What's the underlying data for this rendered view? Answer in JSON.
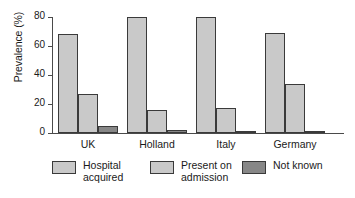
{
  "chart_data": {
    "type": "bar",
    "title": "",
    "xlabel": "",
    "ylabel": "Prevalence (%)",
    "ylim": [
      0,
      80
    ],
    "yticks": [
      0,
      20,
      40,
      60,
      80
    ],
    "ytick_labels": [
      "0",
      "20",
      "40",
      "60",
      "80"
    ],
    "grid": false,
    "legend_position": "bottom",
    "categories": [
      "UK",
      "Holland",
      "Italy",
      "Germany"
    ],
    "series": [
      {
        "name": "Hospital acquired",
        "name_line1": "Hospital",
        "name_line2": "acquired",
        "color": "#c9c9c9",
        "values": [
          68,
          80,
          80,
          69
        ]
      },
      {
        "name": "Present on admission",
        "name_line1": "Present on",
        "name_line2": "admission",
        "color": "#c9c9c9",
        "values": [
          27,
          16,
          17,
          34
        ]
      },
      {
        "name": "Not known",
        "name_line1": "Not known",
        "name_line2": "",
        "color": "#878787",
        "values": [
          5,
          2,
          1.5,
          1
        ]
      }
    ]
  },
  "axis": {
    "y_title": "Prevalence (%)"
  },
  "colors": {
    "bar_light": "#c9c9c9",
    "bar_dark": "#878787",
    "outline": "#3a3a3a",
    "axis": "#4a4a4a",
    "background": "#ffffff"
  }
}
